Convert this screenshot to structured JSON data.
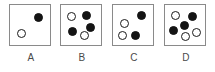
{
  "figure": {
    "type": "multiple-choice-dot-pattern",
    "background_color": "#ffffff",
    "box_border_color": "#8a8a8a",
    "filled_dot_color": "#141414",
    "open_dot_color": "#ffffff",
    "open_dot_border_color": "#1a1a1a",
    "label_color": "#4a4a4a",
    "options": [
      {
        "label": "A",
        "left": 6,
        "filled_count": 1,
        "open_count": 2,
        "total_count": 2,
        "dots": [
          {
            "kind": "filled",
            "x": 24,
            "y": 8,
            "d": 9
          },
          {
            "kind": "open",
            "x": 7,
            "y": 24,
            "d": 9
          }
        ]
      },
      {
        "label": "B",
        "left": 57,
        "filled_count": 3,
        "open_count": 2,
        "total_count": 5,
        "dots": [
          {
            "kind": "open",
            "x": 6,
            "y": 7,
            "d": 9
          },
          {
            "kind": "filled",
            "x": 21,
            "y": 6,
            "d": 9
          },
          {
            "kind": "filled",
            "x": 25,
            "y": 18,
            "d": 9
          },
          {
            "kind": "filled",
            "x": 7,
            "y": 22,
            "d": 9
          },
          {
            "kind": "open",
            "x": 19,
            "y": 26,
            "d": 9
          }
        ]
      },
      {
        "label": "C",
        "left": 109,
        "filled_count": 2,
        "open_count": 2,
        "total_count": 4,
        "dots": [
          {
            "kind": "filled",
            "x": 24,
            "y": 6,
            "d": 9
          },
          {
            "kind": "open",
            "x": 7,
            "y": 14,
            "d": 9
          },
          {
            "kind": "open",
            "x": 5,
            "y": 26,
            "d": 9
          },
          {
            "kind": "filled",
            "x": 18,
            "y": 26,
            "d": 9
          }
        ]
      },
      {
        "label": "D",
        "left": 161,
        "filled_count": 3,
        "open_count": 3,
        "total_count": 6,
        "dots": [
          {
            "kind": "open",
            "x": 6,
            "y": 6,
            "d": 9
          },
          {
            "kind": "filled",
            "x": 23,
            "y": 7,
            "d": 9
          },
          {
            "kind": "filled",
            "x": 15,
            "y": 16,
            "d": 9
          },
          {
            "kind": "filled",
            "x": 4,
            "y": 21,
            "d": 9
          },
          {
            "kind": "open",
            "x": 16,
            "y": 27,
            "d": 9
          },
          {
            "kind": "open",
            "x": 27,
            "y": 23,
            "d": 9
          }
        ]
      }
    ]
  }
}
